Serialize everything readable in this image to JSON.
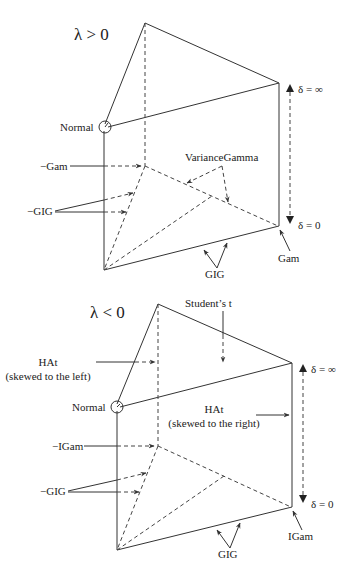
{
  "panels": [
    {
      "condition": "λ > 0",
      "labels": {
        "normal": "Normal",
        "neg_gam": "−Gam",
        "neg_gig": "−GIG",
        "variance_gamma": "VarianceGamma",
        "gig": "GIG",
        "gam": "Gam",
        "delta_inf": "δ = ∞",
        "delta_zero": "δ = 0"
      }
    },
    {
      "condition": "λ < 0",
      "labels": {
        "normal": "Normal",
        "students_t": "Student’s t",
        "hat_left_1": "HAt",
        "hat_left_2": "(skewed to the left)",
        "hat_right_1": "HAt",
        "hat_right_2": "(skewed to the right)",
        "neg_igam": "−IGam",
        "neg_gig": "−GIG",
        "gig": "GIG",
        "igam": "IGam",
        "delta_inf": "δ = ∞",
        "delta_zero": "δ = 0"
      }
    }
  ]
}
